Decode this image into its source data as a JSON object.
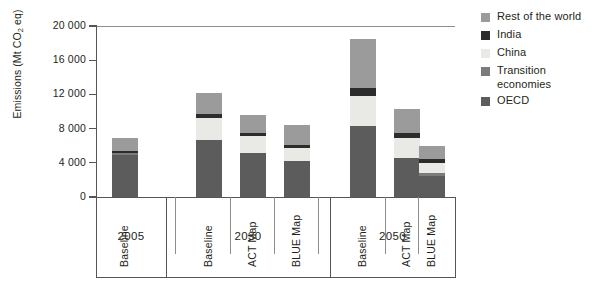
{
  "chart_data": {
    "type": "bar",
    "subtype": "stacked-bar",
    "title": "",
    "xlabel": "",
    "ylabel": "Emissions (Mt CO2 eq)",
    "ylabel_parts": {
      "pre": "Emissions (Mt CO",
      "sub": "2",
      "post": " eq)"
    },
    "ylim": [
      0,
      20000
    ],
    "ytick_values": [
      0,
      4000,
      8000,
      12000,
      16000,
      20000
    ],
    "ytick_labels": [
      "0",
      "4 000",
      "8 000",
      "12 000",
      "16 000",
      "20 000"
    ],
    "grid": false,
    "legend_position": "right",
    "categories": [
      "2005 Baseline",
      "2030 Baseline",
      "2030 ACT Map",
      "2030 BLUE Map",
      "2050 Baseline",
      "2050 ACT Map",
      "2050 BLUE Map"
    ],
    "scenario_labels": [
      "Baseline",
      "Baseline",
      "ACT Map",
      "BLUE Map",
      "Baseline",
      "ACT Map",
      "BLUE Map"
    ],
    "year_groups": [
      {
        "year": "2005",
        "count": 1
      },
      {
        "year": "2030",
        "count": 3
      },
      {
        "year": "2050",
        "count": 3
      }
    ],
    "series": [
      {
        "name": "OECD",
        "color": "#5c5c5c",
        "values": [
          4900,
          6700,
          5100,
          4200,
          8300,
          4600,
          2500
        ]
      },
      {
        "name": "Transition economies",
        "color": "#7b7b7b",
        "values": [
          300,
          0,
          0,
          0,
          0,
          0,
          300
        ]
      },
      {
        "name": "China",
        "color": "#e9e9e6",
        "values": [
          0,
          2500,
          2000,
          1500,
          3500,
          2300,
          1200
        ]
      },
      {
        "name": "India",
        "color": "#2c2c2c",
        "values": [
          200,
          500,
          400,
          350,
          900,
          600,
          400
        ]
      },
      {
        "name": "Rest of the world",
        "color": "#9b9b9b",
        "values": [
          1500,
          2500,
          2100,
          2350,
          5800,
          2800,
          1600
        ]
      }
    ],
    "totals": [
      6900,
      12200,
      9600,
      8400,
      18500,
      10300,
      6000
    ],
    "legend_order": [
      "Rest of the world",
      "India",
      "China",
      "Transition economies",
      "OECD"
    ]
  },
  "legend": {
    "items": [
      {
        "label": "Rest of the world",
        "color": "#9b9b9b"
      },
      {
        "label": "India",
        "color": "#2c2c2c"
      },
      {
        "label": "China",
        "color": "#e9e9e6"
      },
      {
        "label": "Transition economies",
        "color": "#7b7b7b"
      },
      {
        "label": "OECD",
        "color": "#5c5c5c"
      }
    ]
  },
  "colors": {
    "axis": "#555555",
    "separator": "#8d8d8d",
    "text": "#231f20",
    "background": "#ffffff"
  }
}
